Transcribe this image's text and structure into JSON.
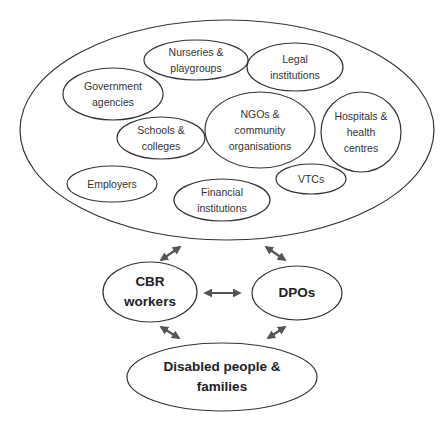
{
  "diagram": {
    "outer_group": {
      "name": "community-stakeholders",
      "members": [
        {
          "id": "nurseries",
          "label": "Nurseries &\nplaygroups"
        },
        {
          "id": "legal",
          "label": "Legal\ninstitutions"
        },
        {
          "id": "government",
          "label": "Government\nagencies"
        },
        {
          "id": "ngos",
          "label": "NGOs &\ncommunity\norganisations"
        },
        {
          "id": "hospitals",
          "label": "Hospitals &\nhealth\ncentres"
        },
        {
          "id": "schools",
          "label": "Schools &\ncolleges"
        },
        {
          "id": "employers",
          "label": "Employers"
        },
        {
          "id": "financial",
          "label": "Financial\ninstitutions"
        },
        {
          "id": "vtcs",
          "label": "VTCs"
        }
      ]
    },
    "nodes": [
      {
        "id": "cbr",
        "label": "CBR\nworkers"
      },
      {
        "id": "dpos",
        "label": "DPOs"
      },
      {
        "id": "disabled",
        "label": "Disabled people &\nfamilies"
      }
    ],
    "edges": [
      {
        "from": "outer_group",
        "to": "cbr",
        "type": "bidirectional"
      },
      {
        "from": "outer_group",
        "to": "dpos",
        "type": "bidirectional"
      },
      {
        "from": "cbr",
        "to": "dpos",
        "type": "bidirectional"
      },
      {
        "from": "cbr",
        "to": "disabled",
        "type": "bidirectional"
      },
      {
        "from": "dpos",
        "to": "disabled",
        "type": "bidirectional"
      }
    ],
    "colors": {
      "stroke": "#333333",
      "arrow": "#555555",
      "background": "#ffffff"
    }
  }
}
